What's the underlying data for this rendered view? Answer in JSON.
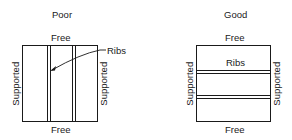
{
  "panels": [
    {
      "title": "Poor",
      "top_edge": "Free",
      "bottom_edge": "Free",
      "left_edge": "Supported",
      "right_edge": "Supported",
      "rib_label": "Ribs",
      "rib_orientation": "vertical",
      "rib_count": 2
    },
    {
      "title": "Good",
      "top_edge": "Free",
      "bottom_edge": "Free",
      "left_edge": "Supported",
      "right_edge": "Supported",
      "rib_label": "Ribs",
      "rib_orientation": "horizontal",
      "rib_count": 2
    }
  ],
  "colors": {
    "line": "#1a1a1a",
    "background": "#ffffff"
  }
}
